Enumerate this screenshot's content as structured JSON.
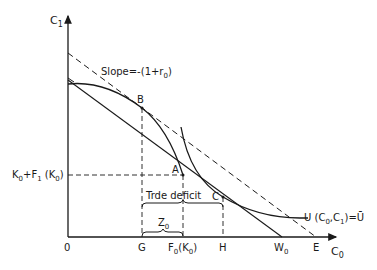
{
  "axes": {
    "y_label": "C",
    "y_label_sub": "1",
    "x_label": "C",
    "x_label_sub": "0",
    "origin_label": "0"
  },
  "annotations": {
    "slope_label": "Slope=-(1+r",
    "slope_sub": "0",
    "slope_close": ")",
    "point_b": "B",
    "point_a": "A",
    "point_c": "C",
    "trade_deficit": "Trde deficit",
    "z_label": "Z",
    "z_sub": "0",
    "utility_label_prefix": "U (C",
    "utility_sub0": "0",
    "utility_mid": ",C",
    "utility_sub1": "1",
    "utility_suffix": ")=Ū",
    "y_tick_k0": "K",
    "y_tick_k0_sub": "0",
    "y_tick_plus": "+F",
    "y_tick_f1_sub": "1",
    "y_tick_paren": " (K",
    "y_tick_k0b_sub": "0",
    "y_tick_close": ")"
  },
  "x_ticks": {
    "g": "G",
    "f0_prefix": "F",
    "f0_sub": "0",
    "f0_suffix": "(K",
    "f0_sub2": "0",
    "f0_close": ")",
    "h": "H",
    "w0": "W",
    "w0_sub": "0",
    "e": "E"
  },
  "colors": {
    "ink": "#1a1a1a",
    "background": "#ffffff"
  }
}
